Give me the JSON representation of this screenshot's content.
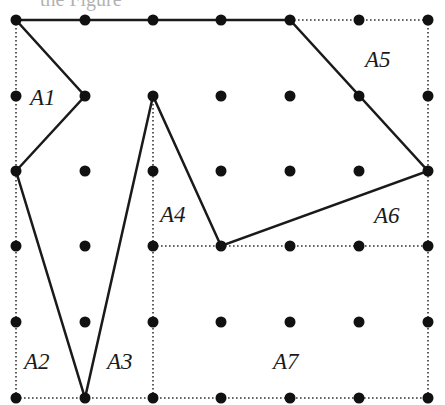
{
  "diagram": {
    "title_fragment": "the Figure",
    "grid": {
      "columns": 7,
      "rows": 6,
      "x_positions": [
        16,
        85,
        153,
        221,
        290,
        359,
        428
      ],
      "y_positions": [
        20,
        96,
        171,
        246,
        322,
        398
      ],
      "dot_color": "#111111",
      "dot_radius": 5.5
    },
    "polygon": {
      "stroke": "#1a1a1a",
      "stroke_width": 2.5,
      "vertices_grid": [
        [
          0,
          0
        ],
        [
          4,
          0
        ],
        [
          6,
          2
        ],
        [
          3,
          3
        ],
        [
          2,
          1
        ],
        [
          1,
          5
        ],
        [
          0,
          2
        ],
        [
          1,
          1
        ]
      ]
    },
    "dotted_lines": [
      {
        "from": [
          0,
          0
        ],
        "to": [
          0,
          5
        ]
      },
      {
        "from": [
          4,
          0
        ],
        "to": [
          6,
          0
        ]
      },
      {
        "from": [
          6,
          0
        ],
        "to": [
          6,
          5
        ]
      },
      {
        "from": [
          0,
          5
        ],
        "to": [
          6,
          5
        ]
      },
      {
        "from": [
          2,
          1
        ],
        "to": [
          2,
          5
        ]
      },
      {
        "from": [
          2,
          3
        ],
        "to": [
          6,
          3
        ]
      }
    ],
    "region_labels": [
      {
        "id": "A1",
        "text": "A1",
        "x": 30,
        "y": 86
      },
      {
        "id": "A2",
        "text": "A2",
        "x": 24,
        "y": 350
      },
      {
        "id": "A3",
        "text": "A3",
        "x": 107,
        "y": 350
      },
      {
        "id": "A4",
        "text": "A4",
        "x": 160,
        "y": 203
      },
      {
        "id": "A5",
        "text": "A5",
        "x": 365,
        "y": 48
      },
      {
        "id": "A6",
        "text": "A6",
        "x": 374,
        "y": 204
      },
      {
        "id": "A7",
        "text": "A7",
        "x": 273,
        "y": 350
      }
    ]
  }
}
